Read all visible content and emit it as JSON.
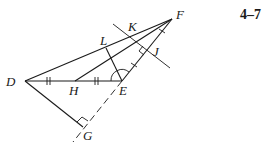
{
  "figure_number": "4–7",
  "points": {
    "D": {
      "label": "D",
      "x": 25,
      "y": 81
    },
    "E": {
      "label": "E",
      "x": 122,
      "y": 81
    },
    "F": {
      "label": "F",
      "x": 172,
      "y": 19
    },
    "H": {
      "label": "H",
      "x": 75,
      "y": 81
    },
    "L": {
      "label": "L",
      "x": 106,
      "y": 48
    },
    "G": {
      "label": "G",
      "x": 83,
      "y": 127
    },
    "K": {
      "label": "K",
      "x": 133,
      "y": 36
    },
    "J": {
      "label": "J",
      "x": 148,
      "y": 50
    }
  },
  "segments": [
    {
      "name": "DF",
      "from": "D",
      "to": "F",
      "style": "solid"
    },
    {
      "name": "DE",
      "from": "D",
      "to": "E",
      "style": "solid"
    },
    {
      "name": "EF",
      "from": "E",
      "to": "F",
      "style": "solid"
    },
    {
      "name": "HF",
      "from": "H",
      "to": "F",
      "style": "solid"
    },
    {
      "name": "EL",
      "from": "E",
      "to": "L",
      "style": "solid"
    },
    {
      "name": "DG",
      "from": "D",
      "to": "G",
      "style": "solid"
    },
    {
      "name": "EG",
      "from": "E",
      "to": "G",
      "style": "dashed"
    },
    {
      "name": "perpendicular-bisector-EF",
      "style": "solid"
    }
  ],
  "markings": {
    "DH_HE_equal": "double tick",
    "EJ_JF_equal": "single tick",
    "angle_E_bisected": "arc",
    "right_angle_J": "square",
    "right_angle_G": "square"
  }
}
